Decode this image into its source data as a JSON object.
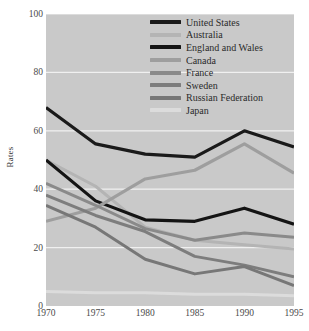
{
  "chart_data": {
    "type": "line",
    "title": "",
    "xlabel": "",
    "ylabel": "Rates",
    "x": [
      1970,
      1975,
      1980,
      1985,
      1990,
      1995
    ],
    "xtick_labels": [
      "1970",
      "1975",
      "1980",
      "1985",
      "1990",
      "1995"
    ],
    "ytick_labels": [
      "0",
      "20",
      "40",
      "60",
      "80",
      "100"
    ],
    "yticks": [
      0,
      20,
      40,
      60,
      80,
      100
    ],
    "ylim": [
      0,
      100
    ],
    "xlim": [
      1970,
      1995
    ],
    "grid": "horizontal",
    "legend_position": "top-right",
    "plot_background": "#c9c9c9",
    "gridline_color": "#f0f0f0",
    "series": [
      {
        "name": "United States",
        "color": "#1a1a1a",
        "width": 3.2,
        "values": [
          68,
          55.5,
          52,
          51,
          60,
          54.5
        ]
      },
      {
        "name": "Australia",
        "color": "#b4b4b4",
        "width": 3.0,
        "values": [
          50,
          41,
          27,
          22.5,
          21,
          19.5
        ]
      },
      {
        "name": "England and Wales",
        "color": "#141414",
        "width": 3.2,
        "values": [
          50,
          36,
          29.5,
          29,
          33.5,
          28
        ]
      },
      {
        "name": "Canada",
        "color": "#9e9e9e",
        "width": 3.2,
        "values": [
          29,
          33.5,
          43.5,
          46.5,
          55.5,
          45.5
        ]
      },
      {
        "name": "France",
        "color": "#8a8a8a",
        "width": 3.0,
        "values": [
          42,
          34.5,
          26.5,
          22.5,
          25,
          23.5
        ]
      },
      {
        "name": "Sweden",
        "color": "#7d7d7d",
        "width": 3.0,
        "values": [
          38,
          31,
          25.5,
          17,
          14,
          10
        ]
      },
      {
        "name": "Russian Federation",
        "color": "#777777",
        "width": 3.0,
        "values": [
          34.5,
          27,
          16,
          11,
          13.5,
          7
        ]
      },
      {
        "name": "Japan",
        "color": "#dcdcdc",
        "width": 3.0,
        "values": [
          5,
          4.5,
          4.5,
          4,
          4,
          3.5
        ]
      }
    ]
  }
}
